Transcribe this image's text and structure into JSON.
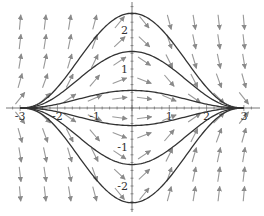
{
  "chart_data": {
    "type": "line",
    "subtype": "slope-field-with-solution-curves",
    "title": "",
    "xlabel": "",
    "ylabel": "",
    "xlim": [
      -3.4,
      3.5
    ],
    "ylim": [
      -2.8,
      2.8
    ],
    "x_ticks": [
      -3,
      -2,
      -1,
      1,
      2,
      3
    ],
    "x_tick_labels": [
      "-3",
      "-2",
      "-1",
      "1",
      "2",
      "3"
    ],
    "y_ticks": [
      -2,
      -1,
      1,
      2
    ],
    "y_tick_labels": [
      "-2",
      "-1",
      "1",
      "2"
    ],
    "grid": false,
    "legend": null,
    "field": {
      "description": "Direction field: arrows point away from x-axis for x<0 and toward x-axis for x>0; all solution curves converge to y=0 at x=-3 and x=3",
      "arrow_color": "#999999",
      "columns_x": [
        -3,
        -2.33,
        -1.67,
        -1,
        -0.33,
        0.33,
        1,
        1.67,
        2.33,
        3
      ],
      "rows_y": [
        2.2,
        1.7,
        1.2,
        0.7,
        0.25,
        -0.25,
        -0.7,
        -1.2,
        -1.7,
        -2.2
      ]
    },
    "series": [
      {
        "name": "solution C=2.43",
        "peak": 2.43,
        "color": "#333333"
      },
      {
        "name": "solution C=1.45",
        "peak": 1.45,
        "color": "#333333"
      },
      {
        "name": "solution C=0.45",
        "peak": 0.45,
        "color": "#333333"
      },
      {
        "name": "solution C=-0.45",
        "peak": -0.45,
        "color": "#333333"
      },
      {
        "name": "solution C=-1.45",
        "peak": -1.45,
        "color": "#333333"
      },
      {
        "name": "solution C=-2.43",
        "peak": -2.43,
        "color": "#333333"
      }
    ],
    "curve_shape": "y = C * ((9 - x^2)/9)^2.6 for -3<=x<=3"
  }
}
